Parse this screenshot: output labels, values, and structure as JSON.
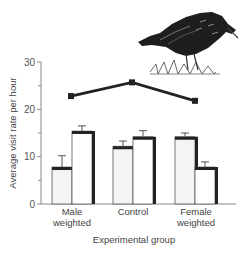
{
  "chart_data": {
    "type": "bar",
    "title": "",
    "xlabel": "Experimental group",
    "ylabel": "Average visit rate per hour",
    "ylim": [
      0,
      30
    ],
    "yticks": [
      0,
      10,
      20,
      30
    ],
    "minor_yticks": [
      5,
      15,
      25
    ],
    "categories": [
      "Male weighted",
      "Control",
      "Female weighted"
    ],
    "category_lines": [
      [
        "Male",
        "weighted"
      ],
      [
        "Control"
      ],
      [
        "Female",
        "weighted"
      ]
    ],
    "series": [
      {
        "name": "Bar 1 (left, shaded)",
        "type": "bar",
        "values": [
          7.8,
          12.2,
          14.2
        ],
        "error_upper": [
          10.2,
          13.3,
          15.0
        ]
      },
      {
        "name": "Bar 2 (right, white)",
        "type": "bar",
        "values": [
          15.4,
          14.2,
          7.8
        ],
        "error_upper": [
          16.5,
          15.5,
          8.9
        ]
      },
      {
        "name": "Total (line)",
        "type": "line",
        "values": [
          22.8,
          25.7,
          21.8
        ]
      }
    ],
    "grid": false,
    "legend": null,
    "decoration": "starling-illustration-top-right"
  },
  "colors": {
    "bar_fill_left": "#f4f4f4",
    "bar_fill_right": "#ffffff",
    "bar_edge": "#222222",
    "line": "#222222",
    "axis": "#888888"
  }
}
